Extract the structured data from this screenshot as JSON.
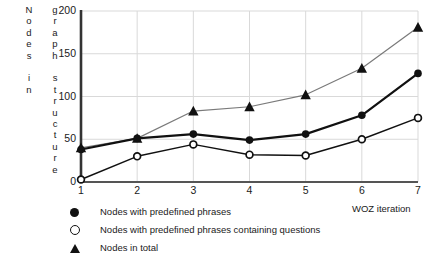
{
  "chart_data": {
    "type": "line",
    "title": "",
    "xlabel": "WOZ iteration",
    "ylabel": "Nodes in graph structure",
    "ylabel_col_1": "Nodes in",
    "ylabel_col_2": "graph structure",
    "x": [
      1,
      2,
      3,
      4,
      5,
      6,
      7
    ],
    "xticklabels": [
      "1",
      "2",
      "3",
      "4",
      "5",
      "6",
      "7"
    ],
    "yticklabels": [
      "200",
      "150",
      "100",
      "50",
      "0"
    ],
    "ytickvalues": [
      200,
      150,
      100,
      50,
      0
    ],
    "xlim": [
      1,
      7
    ],
    "ylim": [
      0,
      200
    ],
    "grid": true,
    "grid_color": "#d9d9d9",
    "legend_position": "below-plot-left",
    "series": [
      {
        "name": "Nodes with predefined phrases",
        "marker": "filled-circle",
        "color": "#111111",
        "line_width": 2.2,
        "values": [
          38,
          51,
          56,
          49,
          56,
          78,
          127
        ]
      },
      {
        "name": "Nodes with predefined phrases containing questions",
        "marker": "open-circle",
        "color": "#111111",
        "line_width": 1.5,
        "values": [
          3,
          30,
          44,
          32,
          31,
          50,
          75
        ]
      },
      {
        "name": "Nodes in total",
        "marker": "triangle",
        "color": "#7a7a7a",
        "line_width": 1.2,
        "values": [
          40,
          51,
          83,
          88,
          102,
          133,
          181
        ]
      }
    ]
  },
  "axis": {
    "y_axis_color": "#333333",
    "x_axis_color": "#555555"
  }
}
